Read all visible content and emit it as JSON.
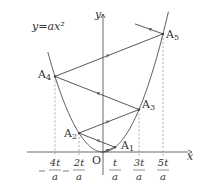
{
  "diagram": {
    "curve_label": "y=ax²",
    "axis_x_label": "x",
    "axis_y_label": "y",
    "origin_label": "O",
    "points": [
      {
        "name": "A1",
        "sub": "1",
        "x_units": 1
      },
      {
        "name": "A2",
        "sub": "2",
        "x_units": -2
      },
      {
        "name": "A3",
        "sub": "3",
        "x_units": 3
      },
      {
        "name": "A4",
        "sub": "4",
        "x_units": -4
      },
      {
        "name": "A5",
        "sub": "5",
        "x_units": 5
      }
    ],
    "ticks": [
      {
        "num": "4t",
        "den": "a",
        "neg": true,
        "x_units": -4
      },
      {
        "num": "2t",
        "den": "a",
        "neg": true,
        "x_units": -2
      },
      {
        "num": "t",
        "den": "a",
        "neg": false,
        "x_units": 1
      },
      {
        "num": "3t",
        "den": "a",
        "neg": false,
        "x_units": 3
      },
      {
        "num": "5t",
        "den": "a",
        "neg": false,
        "x_units": 5
      }
    ],
    "colors": {
      "line": "#444444",
      "dash": "#777777",
      "text": "#333333"
    }
  }
}
